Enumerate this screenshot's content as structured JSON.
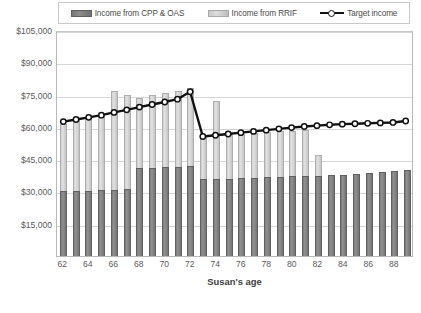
{
  "legend": {
    "items": [
      {
        "label": "Income from CPP & OAS",
        "icon": "legend-swatch-dark",
        "color": "#7b7b7b"
      },
      {
        "label": "Income from RRIF",
        "icon": "legend-swatch-light",
        "color": "#cfcfcf"
      },
      {
        "label": "Target income",
        "icon": "legend-line-marker",
        "color": "#111111"
      }
    ]
  },
  "axis": {
    "x_title": "Susan's age",
    "y_ticks": [
      "$15,000",
      "$30,000",
      "$45,000",
      "$60,000",
      "$75,000",
      "$90,000",
      "$105,000"
    ],
    "x_ticks": [
      "62",
      "64",
      "66",
      "68",
      "70",
      "72",
      "74",
      "76",
      "78",
      "80",
      "82",
      "84",
      "86",
      "88"
    ]
  },
  "chart_data": {
    "type": "bar",
    "title": "",
    "xlabel": "Susan's age",
    "ylabel": "",
    "ylim": [
      0,
      105000
    ],
    "ytick_interval": 15000,
    "grid": true,
    "legend_position": "top",
    "stacked": true,
    "categories": [
      62,
      63,
      64,
      65,
      66,
      67,
      68,
      69,
      70,
      71,
      72,
      73,
      74,
      75,
      76,
      77,
      78,
      79,
      80,
      81,
      82,
      83,
      84,
      85,
      86,
      87,
      88,
      89
    ],
    "series": [
      {
        "name": "Income from CPP & OAS",
        "type": "bar",
        "color": "#7b7b7b",
        "values": [
          30000,
          30200,
          30400,
          30600,
          30900,
          31100,
          40800,
          41000,
          41200,
          41400,
          41700,
          35600,
          35800,
          36000,
          36200,
          36400,
          36600,
          36800,
          37000,
          37200,
          37400,
          37600,
          37800,
          38100,
          38600,
          39000,
          39400,
          40000
        ]
      },
      {
        "name": "Income from RRIF",
        "type": "bar",
        "color": "#cfcfcf",
        "values": [
          31500,
          32900,
          33600,
          34600,
          45900,
          43600,
          32800,
          33700,
          34600,
          35400,
          36500,
          20300,
          36200,
          20300,
          20500,
          20700,
          20900,
          21100,
          21300,
          21500,
          9600,
          0,
          0,
          0,
          0,
          0,
          0,
          0
        ]
      },
      {
        "name": "Target income",
        "type": "line",
        "color": "#111111",
        "marker": "circle-open",
        "values": [
          63000,
          64000,
          65000,
          66000,
          67300,
          68500,
          69800,
          71000,
          72200,
          73500,
          77000,
          56000,
          56600,
          57200,
          57800,
          58400,
          59000,
          59600,
          60200,
          60700,
          61100,
          61500,
          61800,
          62000,
          62200,
          62400,
          62600,
          63300
        ]
      }
    ]
  }
}
